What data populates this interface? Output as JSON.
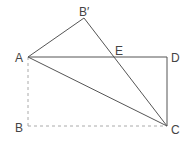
{
  "diagram": {
    "type": "geometry-figure",
    "stroke_color": "#555555",
    "dashed_color": "#aaaaaa",
    "points": {
      "A": {
        "label": "A",
        "x": 28,
        "y": 57
      },
      "B": {
        "label": "B",
        "x": 28,
        "y": 126
      },
      "C": {
        "label": "C",
        "x": 167,
        "y": 126
      },
      "D": {
        "label": "D",
        "x": 167,
        "y": 57
      },
      "Bp": {
        "label": "B′",
        "x": 84,
        "y": 18
      },
      "E": {
        "label": "E",
        "x": 115,
        "y": 57
      }
    },
    "segments": [
      {
        "from": "A",
        "to": "Bp",
        "style": "solid"
      },
      {
        "from": "Bp",
        "to": "C",
        "style": "solid"
      },
      {
        "from": "A",
        "to": "D",
        "style": "solid"
      },
      {
        "from": "D",
        "to": "C",
        "style": "solid"
      },
      {
        "from": "A",
        "to": "C",
        "style": "solid"
      },
      {
        "from": "A",
        "to": "B",
        "style": "dashed"
      },
      {
        "from": "B",
        "to": "C",
        "style": "dashed"
      }
    ]
  }
}
